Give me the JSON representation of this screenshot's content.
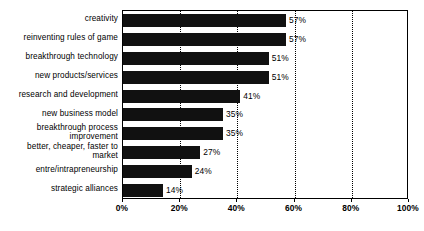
{
  "chart_data": {
    "type": "bar",
    "orientation": "horizontal",
    "title": "",
    "subtitle": "",
    "xlabel": "",
    "ylabel": "",
    "xlim": [
      0,
      100
    ],
    "xticks": [
      0,
      20,
      40,
      60,
      80,
      100
    ],
    "xtick_labels": [
      "0%",
      "20%",
      "40%",
      "60%",
      "80%",
      "100%"
    ],
    "grid": "vertical-dotted",
    "legend": "none",
    "bar_color": "#111111",
    "categories": [
      "creativity",
      "reinventing rules of game",
      "breakthrough technology",
      "new products/services",
      "research and development",
      "new business model",
      "breakthrough process\nimprovement",
      "better, cheaper, faster to\nmarket",
      "entre/intrapreneurship",
      "strategic alliances"
    ],
    "values": [
      57,
      57,
      51,
      51,
      41,
      35,
      35,
      27,
      24,
      14
    ],
    "data_labels": [
      "57%",
      "57%",
      "51%",
      "51%",
      "41%",
      "35%",
      "35%",
      "27%",
      "24%",
      "14%"
    ]
  }
}
